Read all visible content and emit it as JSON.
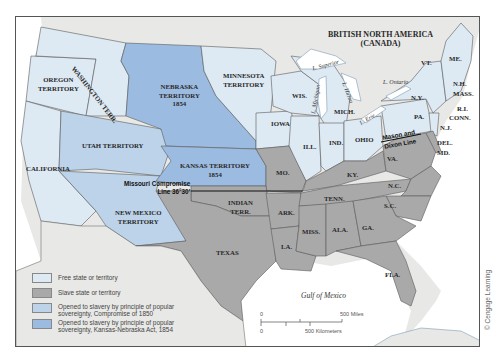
{
  "map": {
    "title_region": "BRITISH NORTH AMERICA",
    "title_region_sub": "(CANADA)",
    "colors": {
      "free": "#dde9f3",
      "slave": "#a9a9a9",
      "compromise_1850": "#bcd3ea",
      "kansas_nebraska_1854": "#9cbbe0",
      "foreign": "#e8e8e6",
      "water": "#ffffff",
      "border": "#5a5a5a"
    },
    "labels": {
      "washington": "WASHINGTON TERR.",
      "oregon_1": "OREGON",
      "oregon_2": "TERRITORY",
      "california": "CALIFORNIA",
      "utah": "UTAH TERRITORY",
      "nebraska_1": "NEBRASKA",
      "nebraska_2": "TERRITORY",
      "nebraska_3": "1854",
      "minnesota_1": "MINNESOTA",
      "minnesota_2": "TERRITORY",
      "kansas_1": "KANSAS TERRITORY",
      "kansas_2": "1854",
      "new_mexico_1": "NEW MEXICO",
      "new_mexico_2": "TERRITORY",
      "indian_1": "INDIAN",
      "indian_2": "TERR.",
      "texas": "TEXAS",
      "iowa": "IOWA",
      "mo": "MO.",
      "ark": "ARK.",
      "la": "LA.",
      "wis": "WIS.",
      "ill": "ILL.",
      "ind": "IND.",
      "ohio": "OHIO",
      "mich": "MICH.",
      "ky": "KY.",
      "tenn": "TENN.",
      "miss": "MISS.",
      "ala": "ALA.",
      "ga": "GA.",
      "fla": "FLA.",
      "sc": "S.C.",
      "nc": "N.C.",
      "va": "VA.",
      "md": "MD.",
      "del": "DEL.",
      "nj": "N.J.",
      "pa": "PA.",
      "ny": "N.Y.",
      "vt": "VT.",
      "nh": "N.H.",
      "me": "ME.",
      "mass": "MASS.",
      "ri": "R.I.",
      "conn": "CONN.",
      "l_superior": "L. Superior",
      "l_michigan": "L. Michigan",
      "l_huron": "L. Huron",
      "l_erie": "L. Erie",
      "l_ontario": "L. Ontario",
      "gulf": "Gulf of Mexico",
      "missouri_compromise_1": "Missouri Compromise",
      "missouri_compromise_2": "Line 36°30′",
      "mason_dixon_1": "Mason and",
      "mason_dixon_2": "Dixon Line"
    },
    "legend": [
      {
        "swatch": "free",
        "text": "Free state or territory"
      },
      {
        "swatch": "slave",
        "text": "Slave state or territory"
      },
      {
        "swatch": "compromise_1850",
        "text": "Opened to slavery by principle of popular sovereignty, Compromise of 1850"
      },
      {
        "swatch": "kansas_nebraska_1854",
        "text": "Opened to slavery by principle of popular sovereignty, Kansas-Nebraska Act, 1854"
      }
    ],
    "scale": {
      "zero_top": "0",
      "zero_bottom": "0",
      "miles": "500 Miles",
      "kilometers": "500 Kilometers"
    },
    "credit": "© Cengage Learning"
  }
}
